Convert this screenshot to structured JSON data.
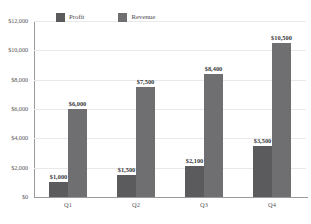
{
  "chart_data": {
    "type": "bar",
    "title": "",
    "subtitle": "",
    "xlabel": "",
    "ylabel": "",
    "categories": [
      "Q1",
      "Q2",
      "Q3",
      "Q4"
    ],
    "series": [
      {
        "name": "Profit",
        "color": "#5b5b5d",
        "values": [
          1000,
          1500,
          2100,
          3500
        ],
        "labels": [
          "$1,000",
          "$1,500",
          "$2,100",
          "$3,500"
        ]
      },
      {
        "name": "Revenue",
        "color": "#6f6f71",
        "values": [
          6000,
          7500,
          8400,
          10500
        ],
        "labels": [
          "$6,000",
          "$7,500",
          "$8,400",
          "$10,500"
        ]
      }
    ],
    "ylim": [
      0,
      12000
    ],
    "yticks": [
      0,
      2000,
      4000,
      6000,
      8000,
      10000,
      12000
    ],
    "ytick_labels": [
      "$0",
      "$2,000",
      "$4,000",
      "$6,000",
      "$8,000",
      "$10,000",
      "$12,000"
    ],
    "grid": true,
    "grid_axis": "y",
    "legend": true,
    "legend_position": "top-left-inside",
    "data_labels": true
  },
  "axis": {
    "y_tick_labels": [
      "$12,000",
      "$10,000",
      "$8,000",
      "$6,000",
      "$4,000",
      "$2,000",
      "$0"
    ],
    "x_tick_labels": [
      "Q1",
      "Q2",
      "Q3",
      "Q4"
    ]
  },
  "legend": {
    "items": [
      {
        "label": "Profit",
        "color": "#5b5b5d"
      },
      {
        "label": "Revenue",
        "color": "#6f6f71"
      }
    ]
  },
  "colors": {
    "profit": "#5b5b5d",
    "revenue": "#6f6f71",
    "gridline": "#e9e9ea",
    "axis": "#9a9a9c",
    "label_text": "#3a3a3c",
    "tick_text": "#58585a",
    "background": "#ffffff"
  }
}
